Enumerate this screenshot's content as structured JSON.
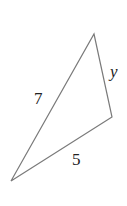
{
  "diagram": {
    "type": "triangle",
    "stroke_color": "#7a7a7a",
    "vertices": {
      "top": [
        94,
        34
      ],
      "right": [
        112,
        117
      ],
      "bottom_left": [
        11,
        181
      ]
    },
    "sides": [
      {
        "id": "left-side",
        "label": "7",
        "from": "bottom_left",
        "to": "top"
      },
      {
        "id": "bottom-side",
        "label": "5",
        "from": "bottom_left",
        "to": "right"
      },
      {
        "id": "right-side",
        "label": "y",
        "from": "top",
        "to": "right"
      }
    ]
  }
}
